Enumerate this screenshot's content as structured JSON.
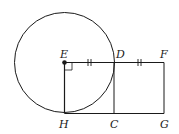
{
  "diagram": {
    "type": "geometry",
    "points": {
      "E": {
        "label": "E",
        "x": 64.5,
        "y": 62.5
      },
      "D": {
        "label": "D",
        "x": 114,
        "y": 62.5
      },
      "F": {
        "label": "F",
        "x": 164,
        "y": 62.5
      },
      "H": {
        "label": "H",
        "x": 64.5,
        "y": 113.5
      },
      "C": {
        "label": "C",
        "x": 114,
        "y": 113.5
      },
      "G": {
        "label": "G",
        "x": 164,
        "y": 113.5
      }
    },
    "circle": {
      "center": "E",
      "radius": 50
    },
    "segments": [
      "EF",
      "HG",
      "EH",
      "DC",
      "FG"
    ],
    "tick_marks": [
      "ED",
      "DF"
    ],
    "right_angle": "HEF",
    "stroke_color": "#1a1a1a"
  }
}
